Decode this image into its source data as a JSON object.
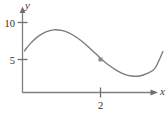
{
  "figure": {
    "background_color": "#ffffff",
    "width": 166,
    "height": 115
  },
  "chart_data": {
    "type": "line",
    "title": "",
    "subtitle": "",
    "xlabel": "x",
    "ylabel": "y",
    "grid": false,
    "legend": null,
    "xlim": [
      0,
      3.7
    ],
    "ylim": [
      0,
      12.2
    ],
    "x_ticks": [
      {
        "value": 2,
        "label": "2"
      }
    ],
    "y_ticks": [
      {
        "value": 5,
        "label": "5"
      },
      {
        "value": 10,
        "label": "10"
      }
    ],
    "series": [
      {
        "name": "curve",
        "color": "#7b7b7b",
        "x": [
          0.05,
          0.2,
          0.4,
          0.6,
          0.8,
          1.0,
          1.2,
          1.4,
          1.6,
          1.8,
          2.0,
          2.2,
          2.4,
          2.6,
          2.8,
          3.0,
          3.2,
          3.4,
          3.6
        ],
        "y": [
          6.3,
          7.4,
          8.5,
          9.2,
          9.5,
          9.4,
          9.0,
          8.3,
          7.4,
          6.3,
          5.2,
          4.2,
          3.4,
          2.8,
          2.5,
          2.5,
          2.9,
          3.7,
          6.2
        ]
      }
    ],
    "markers": [
      {
        "name": "point-on-curve",
        "x": 2.0,
        "y": 5.0,
        "shape": "square",
        "color": "#8a8a8a",
        "size": 4
      }
    ],
    "axes": {
      "x_axis_arrow": true,
      "y_axis_arrow": true,
      "color": "#808080"
    }
  },
  "icons": {
    "x_axis_arrow": "arrow-right-icon",
    "y_axis_arrow": "arrow-up-icon"
  }
}
